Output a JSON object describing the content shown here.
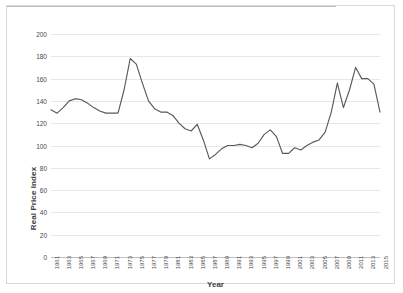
{
  "chart_data": {
    "type": "line",
    "title": "",
    "xlabel": "Year",
    "ylabel": "Real Price Index",
    "ylim": [
      0,
      200
    ],
    "ytick_step": 20,
    "yticks": [
      200,
      180,
      160,
      140,
      120,
      100,
      80,
      60,
      40,
      20,
      0
    ],
    "xlim": [
      1961,
      2015
    ],
    "xticks": [
      1961,
      1963,
      1965,
      1967,
      1969,
      1971,
      1973,
      1975,
      1977,
      1979,
      1981,
      1983,
      1985,
      1987,
      1989,
      1991,
      1993,
      1995,
      1997,
      1999,
      2001,
      2003,
      2005,
      2007,
      2009,
      2011,
      2013,
      2015
    ],
    "grid": true,
    "grid_axis": "y",
    "legend": false,
    "line_color": "#595959",
    "x": [
      1961,
      1962,
      1963,
      1964,
      1965,
      1966,
      1967,
      1968,
      1969,
      1970,
      1971,
      1972,
      1973,
      1974,
      1975,
      1976,
      1977,
      1978,
      1979,
      1980,
      1981,
      1982,
      1983,
      1984,
      1985,
      1986,
      1987,
      1988,
      1989,
      1990,
      1991,
      1992,
      1993,
      1994,
      1995,
      1996,
      1997,
      1998,
      1999,
      2000,
      2001,
      2002,
      2003,
      2004,
      2005,
      2006,
      2007,
      2008,
      2009,
      2010,
      2011,
      2012,
      2013,
      2014,
      2015
    ],
    "values": [
      132,
      129,
      134,
      140,
      142,
      141,
      138,
      134,
      131,
      129,
      129,
      129,
      150,
      178,
      173,
      156,
      140,
      133,
      130,
      130,
      127,
      120,
      115,
      113,
      119,
      105,
      88,
      92,
      97,
      100,
      100,
      101,
      100,
      98,
      102,
      110,
      114,
      108,
      93,
      93,
      98,
      96,
      100,
      103,
      105,
      112,
      130,
      156,
      134,
      150,
      170,
      160,
      160,
      155,
      130
    ],
    "series": [
      {
        "name": "Real Price Index",
        "values": [
          132,
          129,
          134,
          140,
          142,
          141,
          138,
          134,
          131,
          129,
          129,
          129,
          150,
          178,
          173,
          156,
          140,
          133,
          130,
          130,
          127,
          120,
          115,
          113,
          119,
          105,
          88,
          92,
          97,
          100,
          100,
          101,
          100,
          98,
          102,
          110,
          114,
          108,
          93,
          93,
          98,
          96,
          100,
          103,
          105,
          112,
          130,
          156,
          134,
          150,
          170,
          160,
          160,
          155,
          130
        ]
      }
    ],
    "annotations": []
  },
  "axis": {
    "y_title": "Real Price Index",
    "x_title": "Year"
  }
}
